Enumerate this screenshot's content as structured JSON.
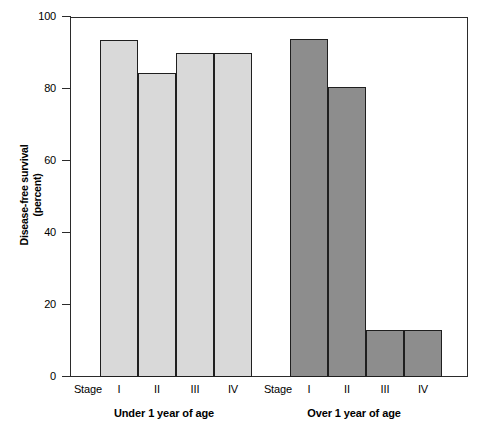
{
  "chart_data": {
    "type": "bar",
    "title": "",
    "subtitle": "",
    "xlabel": "",
    "ylabel": "Disease-free survival\n(percent)",
    "ylabel_line1": "Disease-free survival",
    "ylabel_line2": "(percent)",
    "ylim": [
      0,
      100
    ],
    "yticks": [
      0,
      20,
      40,
      60,
      80,
      100
    ],
    "ytick_labels": [
      "0",
      "20",
      "40",
      "60",
      "80",
      "100"
    ],
    "grid": false,
    "legend": "none",
    "stage_prefix_label": "Stage",
    "categories": [
      "I",
      "II",
      "III",
      "IV"
    ],
    "groups": [
      {
        "name": "Under 1 year of age",
        "label": "Under 1 year of age",
        "fill_color": "#d9d9d9",
        "edge_color": "#1f1f1f",
        "bars": [
          {
            "category": "I",
            "value": 93.5
          },
          {
            "category": "II",
            "value": 84.5
          },
          {
            "category": "III",
            "value": 90
          },
          {
            "category": "IV",
            "value": 90
          }
        ]
      },
      {
        "name": "Over 1 year of age",
        "label": "Over 1 year of age",
        "fill_color": "#8d8d8d",
        "edge_color": "#1f1f1f",
        "bars": [
          {
            "category": "I",
            "value": 94
          },
          {
            "category": "II",
            "value": 80.5
          },
          {
            "category": "III",
            "value": 13
          },
          {
            "category": "IV",
            "value": 13
          }
        ]
      }
    ],
    "series": [
      {
        "name": "Under 1 year of age",
        "values": [
          93.5,
          84.5,
          90,
          90
        ]
      },
      {
        "name": "Over 1 year of age",
        "values": [
          94,
          80.5,
          13,
          13
        ]
      }
    ],
    "colors": {
      "light_bar": "#d9d9d9",
      "dark_bar": "#8d8d8d",
      "axis": "#2b2b2b",
      "background": "#ffffff",
      "text": "#000000"
    }
  }
}
